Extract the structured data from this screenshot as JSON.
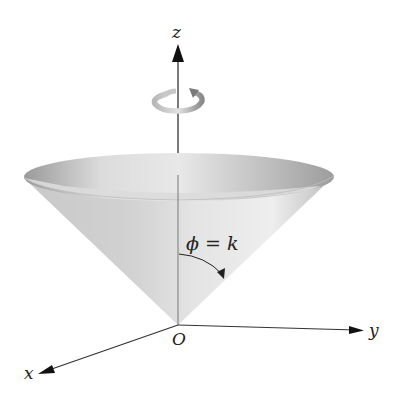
{
  "figure": {
    "axes": {
      "z_label": "z",
      "y_label": "y",
      "x_label": "x",
      "origin_label": "O"
    },
    "annotation": {
      "equation": "ϕ = k"
    },
    "rotation_icon": "rotation-arrow-icon",
    "colors": {
      "axis": "#222222",
      "cone_light": "#e6e6e6",
      "cone_mid": "#c4c4c4",
      "cone_dark": "#8e8e8e",
      "rotation_arrow": "#9a9a9a"
    }
  }
}
